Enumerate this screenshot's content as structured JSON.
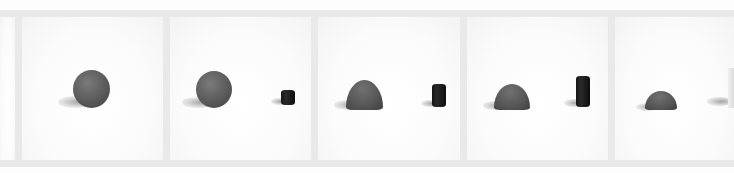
{
  "image": {
    "description": "Film strip sequence of photographs: a gray clay ball gradually flattening into a dome while a small dark cylinder grows taller beside it",
    "width": 734,
    "height": 173
  },
  "colors": {
    "background": "#ffffff",
    "frame_border": "#e9e9e9",
    "clay_ball": "#5a5a5a",
    "cylinder": "#1a1a1a"
  },
  "bands": {
    "top": {
      "x": 0,
      "y": 10,
      "w": 734,
      "h": 7
    },
    "bottom": {
      "x": 0,
      "y": 160,
      "w": 734,
      "h": 7
    }
  },
  "frames": [
    {
      "index": 0,
      "x": 0,
      "y": 17,
      "w": 15,
      "h": 143,
      "partial": true
    },
    {
      "index": 1,
      "x": 22,
      "y": 17,
      "w": 141,
      "h": 143,
      "ball": {
        "shape": "sphere",
        "x": 73,
        "y": 70,
        "w": 37,
        "h": 38
      },
      "cylinder": null
    },
    {
      "index": 2,
      "x": 170,
      "y": 17,
      "w": 141,
      "h": 143,
      "ball": {
        "shape": "sphere",
        "x": 196,
        "y": 71,
        "w": 36,
        "h": 37
      },
      "cylinder": {
        "x": 281,
        "y": 90,
        "w": 14,
        "h": 15
      }
    },
    {
      "index": 3,
      "x": 318,
      "y": 17,
      "w": 142,
      "h": 143,
      "ball": {
        "shape": "dome",
        "x": 346,
        "y": 80,
        "w": 37,
        "h": 30
      },
      "cylinder": {
        "x": 432,
        "y": 84,
        "w": 14,
        "h": 23
      }
    },
    {
      "index": 4,
      "x": 467,
      "y": 17,
      "w": 141,
      "h": 143,
      "ball": {
        "shape": "dome",
        "x": 494,
        "y": 84,
        "w": 36,
        "h": 26
      },
      "cylinder": {
        "x": 576,
        "y": 76,
        "w": 14,
        "h": 31
      }
    },
    {
      "index": 5,
      "x": 615,
      "y": 17,
      "w": 119,
      "h": 143,
      "partial": true,
      "ball": {
        "shape": "dome",
        "x": 645,
        "y": 91,
        "w": 32,
        "h": 19
      },
      "cylinder": {
        "x": 728,
        "y": 68,
        "w": 6,
        "h": 40,
        "clipped": true
      }
    }
  ]
}
